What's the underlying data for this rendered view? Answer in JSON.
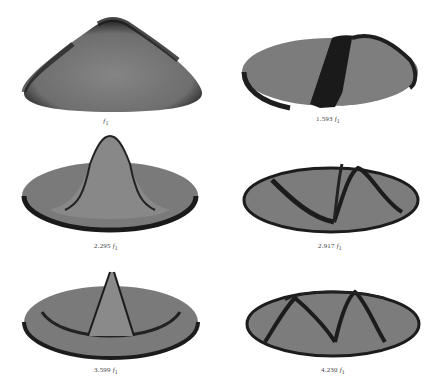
{
  "figure": {
    "fill_color": "#7a7a7a",
    "shade_color": "#1a1a1a",
    "panels": [
      {
        "id": "mode-1",
        "label": "f",
        "subscript": "1",
        "multiplier": "",
        "description": "fundamental dome mode"
      },
      {
        "id": "mode-2",
        "label": "1.593 f",
        "subscript": "1",
        "multiplier": "1.593",
        "description": "one nodal diameter"
      },
      {
        "id": "mode-3",
        "label": "2.295 f",
        "subscript": "1",
        "multiplier": "2.295",
        "description": "one nodal circle, central peak"
      },
      {
        "id": "mode-4",
        "label": "2.917 f",
        "subscript": "1",
        "multiplier": "2.917",
        "description": "two nodal diameters"
      },
      {
        "id": "mode-5",
        "label": "3.599 f",
        "subscript": "1",
        "multiplier": "3.599",
        "description": "one nodal diameter and one nodal circle"
      },
      {
        "id": "mode-6",
        "label": "4.230 f",
        "subscript": "1",
        "multiplier": "4.230",
        "description": "three nodal diameters"
      }
    ]
  }
}
